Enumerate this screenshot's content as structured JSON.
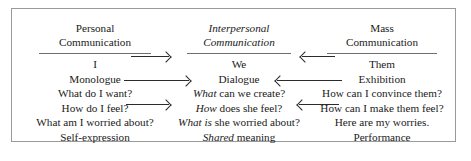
{
  "diagram": {
    "border_color": "#9a9a9a",
    "rule_color": "#6e6e6e",
    "text_color": "#1a1a1a",
    "arrow_color": "#2b2b2b",
    "columns": [
      {
        "id": "personal",
        "header_line1": "Personal",
        "header_line2": "Communication",
        "header_style": "regular",
        "lines": [
          {
            "italic_part": "",
            "regular_part": "I"
          },
          {
            "italic_part": "",
            "regular_part": "Monologue"
          },
          {
            "italic_part": "",
            "regular_part": "What do I want?"
          },
          {
            "italic_part": "",
            "regular_part": "How do I feel?"
          },
          {
            "italic_part": "",
            "regular_part": "What am I worried about?"
          },
          {
            "italic_part": "",
            "regular_part": "Self-expression"
          }
        ]
      },
      {
        "id": "interpersonal",
        "header_line1": "Interpersonal",
        "header_line2": "Communication",
        "header_style": "italic",
        "lines": [
          {
            "italic_part": "",
            "regular_part": "We"
          },
          {
            "italic_part": "",
            "regular_part": "Dialogue"
          },
          {
            "italic_part": "What",
            "regular_part": " can we create?"
          },
          {
            "italic_part": "How",
            "regular_part": " does she feel?"
          },
          {
            "italic_part": "What is",
            "regular_part": " she worried about?"
          },
          {
            "italic_part": "Shared",
            "regular_part": " meaning"
          }
        ]
      },
      {
        "id": "mass",
        "header_line1": "Mass",
        "header_line2": "Communication",
        "header_style": "regular",
        "lines": [
          {
            "italic_part": "",
            "regular_part": "Them"
          },
          {
            "italic_part": "",
            "regular_part": "Exhibition"
          },
          {
            "italic_part": "",
            "regular_part": "How can I convince them?"
          },
          {
            "italic_part": "",
            "regular_part": "How can I make them feel?"
          },
          {
            "italic_part": "",
            "regular_part": "Here are my worries."
          },
          {
            "italic_part": "",
            "regular_part": "Performance"
          }
        ]
      }
    ],
    "arrows": [
      {
        "id": "left-to-mid-top",
        "direction": "right",
        "label": "Personal to Interpersonal (top)"
      },
      {
        "id": "left-to-mid-middle",
        "direction": "right",
        "label": "Personal to Interpersonal (middle)"
      },
      {
        "id": "left-to-mid-lower",
        "direction": "right",
        "label": "Personal to Interpersonal (lower)"
      },
      {
        "id": "right-to-mid-top",
        "direction": "left",
        "label": "Mass to Interpersonal (top)"
      },
      {
        "id": "right-to-mid-middle",
        "direction": "left",
        "label": "Mass to Interpersonal (middle)"
      },
      {
        "id": "right-to-mid-lower",
        "direction": "left",
        "label": "Mass to Interpersonal (lower)"
      }
    ]
  }
}
